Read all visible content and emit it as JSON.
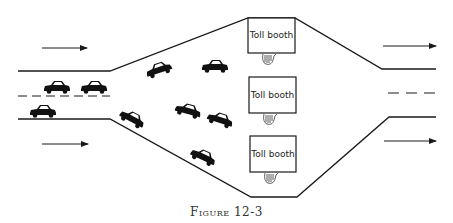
{
  "figure": {
    "caption_word": "Figure",
    "caption_number": "12-3"
  },
  "booths": [
    {
      "label": "Toll booth"
    },
    {
      "label": "Toll booth"
    },
    {
      "label": "Toll booth"
    }
  ],
  "traffic": {
    "direction": "left-to-right",
    "inbound_lanes": 2,
    "outbound_lanes": 2,
    "booth_count": 3,
    "car_count": 10
  },
  "colors": {
    "ink": "#1a1a1a",
    "background": "#ffffff"
  }
}
